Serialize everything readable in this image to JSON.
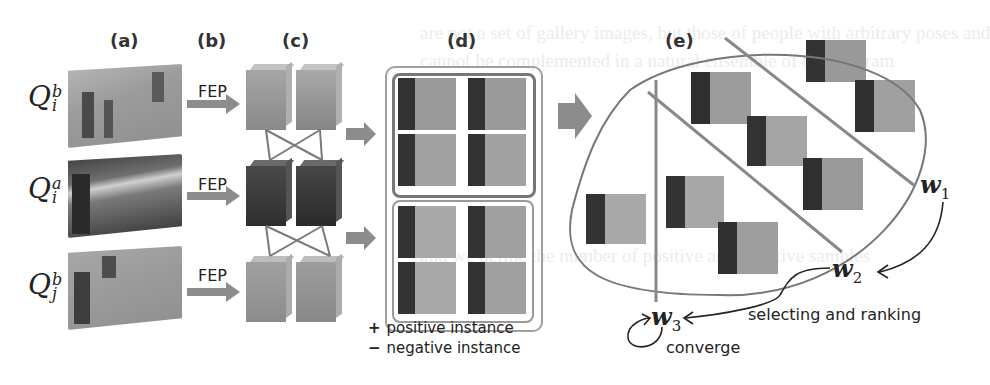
{
  "figure": {
    "panels": [
      {
        "id": "a",
        "label": "(a)"
      },
      {
        "id": "b",
        "label": "(b)"
      },
      {
        "id": "c",
        "label": "(c)"
      },
      {
        "id": "d",
        "label": "(d)"
      },
      {
        "id": "e",
        "label": "(e)"
      }
    ],
    "rows": [
      {
        "symbol": "Q",
        "sup": "b",
        "sub": "i",
        "arrow_label": "FEP"
      },
      {
        "symbol": "Q",
        "sup": "a",
        "sub": "i",
        "arrow_label": "FEP"
      },
      {
        "symbol": "Q",
        "sup": "b",
        "sub": "j",
        "arrow_label": "FEP"
      }
    ],
    "legend": {
      "positive": {
        "marker": "+",
        "text": "positive instance"
      },
      "negative": {
        "marker": "−",
        "text": "negative instance"
      }
    },
    "weights": [
      {
        "symbol": "w",
        "sub": "1"
      },
      {
        "symbol": "w",
        "sub": "2"
      },
      {
        "symbol": "w",
        "sub": "3"
      }
    ],
    "annotations": {
      "selecting": "selecting and ranking",
      "converge": "converge"
    },
    "colors": {
      "line": "#8a8a8a",
      "arrow": "#8c8c8c",
      "text": "#222222",
      "frame": "#888888"
    }
  }
}
